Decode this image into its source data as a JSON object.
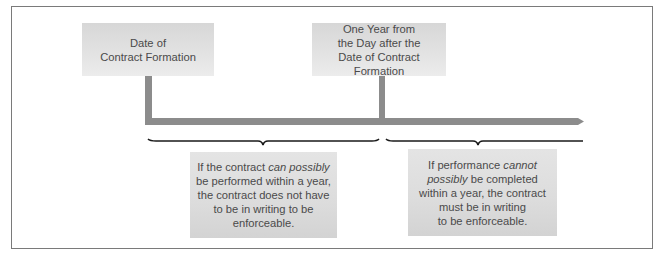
{
  "diagram": {
    "type": "timeline",
    "colors": {
      "timeline_bar": "#8c8c8c",
      "box_fill": "#dedede",
      "text": "#4a4a4a",
      "brace": "#1a1a1a",
      "frame": "#7a7a7a"
    },
    "markers": [
      {
        "id": "start",
        "lines": [
          "Date of",
          "Contract Formation"
        ]
      },
      {
        "id": "one-year",
        "lines": [
          "One Year from",
          "the Day after the",
          "Date of Contract Formation"
        ]
      }
    ],
    "periods": [
      {
        "id": "within-one-year",
        "lines": [
          [
            {
              "t": "If the contract "
            },
            {
              "t": "can possibly",
              "i": true
            }
          ],
          [
            {
              "t": "be performed within a year,"
            }
          ],
          [
            {
              "t": "the contract does not have"
            }
          ],
          [
            {
              "t": "to be in writing to be"
            }
          ],
          [
            {
              "t": "enforceable."
            }
          ]
        ]
      },
      {
        "id": "beyond-one-year",
        "lines": [
          [
            {
              "t": "If performance "
            },
            {
              "t": "cannot",
              "i": true
            }
          ],
          [
            {
              "t": "possibly",
              "i": true
            },
            {
              "t": " be completed"
            }
          ],
          [
            {
              "t": "within a year, the contract"
            }
          ],
          [
            {
              "t": "must be in writing"
            }
          ],
          [
            {
              "t": "to be enforceable."
            }
          ]
        ]
      }
    ]
  }
}
